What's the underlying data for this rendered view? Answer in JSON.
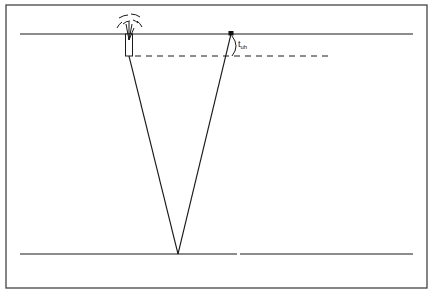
{
  "diagram": {
    "type": "seismic-reflection-raypath",
    "labels": {
      "uphole_time_main": "t",
      "uphole_time_sub": "uh"
    },
    "elements": {
      "surface_line": "ground-surface",
      "reflector_line": "reflector",
      "source": "shot-hole-with-explosion",
      "receiver": "geophone",
      "datum": "dashed-shot-depth-line",
      "raypaths": [
        "incident-ray",
        "reflected-ray"
      ]
    },
    "colors": {
      "line": "#1a1a1a",
      "frame": "#444444",
      "background": "#ffffff"
    }
  }
}
